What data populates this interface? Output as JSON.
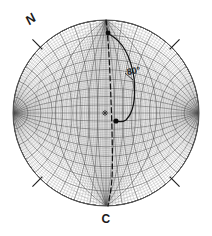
{
  "figure": {
    "panel_label": "C",
    "type": "stereographic-projection-net",
    "north_label": "N",
    "dip_annotation": "80°"
  },
  "chart_data": {
    "type": "scatter",
    "title": "C",
    "subtitle": "Stereographic projection (Wulff net) with great-circle trace",
    "xlabel": "",
    "ylabel": "",
    "grid": true,
    "legend_position": "none",
    "projection": {
      "center_x": 106,
      "center_y": 113,
      "radius": 93,
      "primitive_circle": true,
      "graticule_interval_deg": 2,
      "bold_graticule_interval_deg": 10,
      "pole_top_y": 20,
      "pole_bottom_y": 206
    },
    "annotations": [
      {
        "name": "north-label",
        "text": "N",
        "x": 30,
        "y": 26,
        "rotation_deg": -38
      },
      {
        "name": "dip-label",
        "text": "80°",
        "x": 126,
        "y": 72,
        "rotation_deg": -10
      },
      {
        "name": "panel-label",
        "text": "C",
        "x": 106,
        "y": 222,
        "rotation_deg": 0
      }
    ],
    "ticks": [
      {
        "name": "tick-north",
        "azimuth_deg": 315,
        "length": 14
      },
      {
        "name": "tick-northeast",
        "azimuth_deg": 45,
        "length": 14
      },
      {
        "name": "tick-southwest",
        "azimuth_deg": 225,
        "length": 14
      },
      {
        "name": "tick-southeast",
        "azimuth_deg": 135,
        "length": 14
      }
    ],
    "series": [
      {
        "name": "center-marker",
        "symbol": "asterisk",
        "values": [
          {
            "x": 105,
            "y": 113
          }
        ]
      },
      {
        "name": "data-points",
        "symbol": "filled-circle",
        "values": [
          {
            "x": 108,
            "y": 33
          },
          {
            "x": 116,
            "y": 121
          }
        ]
      },
      {
        "name": "dashed-great-circle",
        "symbol": "dashed-line",
        "values": [
          {
            "x": 106,
            "y": 20
          },
          {
            "x": 109,
            "y": 60
          },
          {
            "x": 111,
            "y": 100
          },
          {
            "x": 113,
            "y": 140
          },
          {
            "x": 112,
            "y": 175
          },
          {
            "x": 108,
            "y": 206
          }
        ]
      },
      {
        "name": "solid-dip-arc",
        "symbol": "solid-line",
        "values": [
          {
            "x": 109,
            "y": 34
          },
          {
            "x": 128,
            "y": 52
          },
          {
            "x": 134,
            "y": 78
          },
          {
            "x": 133,
            "y": 104
          },
          {
            "x": 126,
            "y": 120
          },
          {
            "x": 116,
            "y": 121
          }
        ]
      }
    ]
  }
}
